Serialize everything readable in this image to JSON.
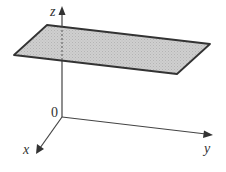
{
  "diagram": {
    "type": "3d-coordinate-axes-with-horizontal-plane",
    "axes": {
      "x": {
        "label": "x"
      },
      "y": {
        "label": "y"
      },
      "z": {
        "label": "z"
      }
    },
    "origin_label": "0",
    "plane": {
      "description": "horizontal plane parallel to xy-plane, above origin",
      "fill": "#c8c8c8",
      "stroke": "#333333"
    },
    "colors": {
      "axis": "#444444",
      "text": "#333333",
      "background": "#ffffff"
    }
  }
}
